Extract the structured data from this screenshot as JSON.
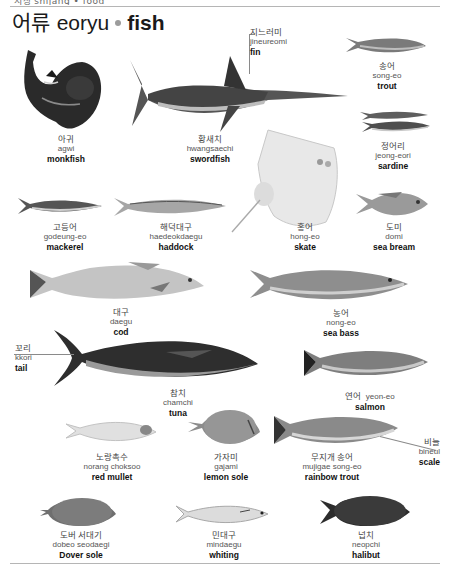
{
  "header": {
    "running_head": "시장 shijang • food",
    "title_ko": "어류",
    "title_rom": "eoryu",
    "title_en": "fish"
  },
  "colors": {
    "text": "#1a1a1a",
    "bullet": "#9c9c9c",
    "rule": "#b5b5b5",
    "leader_line": "#8a8a8a"
  },
  "fish": [
    {
      "id": "monkfish",
      "ko": "아귀",
      "rom": "agwi",
      "en": "monkfish",
      "icon": "monkfish-icon"
    },
    {
      "id": "swordfish",
      "ko": "황새치",
      "rom": "hwangsaechi",
      "en": "swordfish",
      "icon": "swordfish-icon"
    },
    {
      "id": "trout",
      "ko": "송어",
      "rom": "song-eo",
      "en": "trout",
      "icon": "trout-icon"
    },
    {
      "id": "sardine",
      "ko": "정어리",
      "rom": "jeong-eori",
      "en": "sardine",
      "icon": "sardine-icon"
    },
    {
      "id": "mackerel",
      "ko": "고등어",
      "rom": "godeung-eo",
      "en": "mackerel",
      "icon": "mackerel-icon"
    },
    {
      "id": "haddock",
      "ko": "해덕대구",
      "rom": "haedeokdaegu",
      "en": "haddock",
      "icon": "haddock-icon"
    },
    {
      "id": "skate",
      "ko": "홍어",
      "rom": "hong-eo",
      "en": "skate",
      "icon": "skate-icon"
    },
    {
      "id": "sea_bream",
      "ko": "도미",
      "rom": "domi",
      "en": "sea bream",
      "icon": "sea-bream-icon"
    },
    {
      "id": "cod",
      "ko": "대구",
      "rom": "daegu",
      "en": "cod",
      "icon": "cod-icon"
    },
    {
      "id": "sea_bass",
      "ko": "농어",
      "rom": "nong-eo",
      "en": "sea bass",
      "icon": "sea-bass-icon"
    },
    {
      "id": "tuna",
      "ko": "참치",
      "rom": "chamchi",
      "en": "tuna",
      "icon": "tuna-icon"
    },
    {
      "id": "salmon",
      "ko": "연어",
      "rom": "yeon-eo",
      "en": "salmon",
      "icon": "salmon-icon"
    },
    {
      "id": "red_mullet",
      "ko": "노랑촉수",
      "rom": "norang choksoo",
      "en": "red mullet",
      "icon": "red-mullet-icon"
    },
    {
      "id": "lemon_sole",
      "ko": "가자미",
      "rom": "gajami",
      "en": "lemon sole",
      "icon": "lemon-sole-icon"
    },
    {
      "id": "rainbow_trout",
      "ko": "무지개 송어",
      "rom": "mujigae song-eo",
      "en": "rainbow trout",
      "icon": "rainbow-trout-icon"
    },
    {
      "id": "dover_sole",
      "ko": "도버 서대기",
      "rom": "dobeo seodaegi",
      "en": "Dover sole",
      "icon": "dover-sole-icon"
    },
    {
      "id": "whiting",
      "ko": "민대구",
      "rom": "mindaegu",
      "en": "whiting",
      "icon": "whiting-icon"
    },
    {
      "id": "halibut",
      "ko": "넙치",
      "rom": "neopchi",
      "en": "halibut",
      "icon": "halibut-icon"
    }
  ],
  "parts": [
    {
      "id": "fin",
      "ko": "지느러미",
      "rom": "jineureomi",
      "en": "fin"
    },
    {
      "id": "tail",
      "ko": "꼬리",
      "rom": "kkori",
      "en": "tail"
    },
    {
      "id": "scale",
      "ko": "비늘",
      "rom": "bineul",
      "en": "scale"
    }
  ]
}
